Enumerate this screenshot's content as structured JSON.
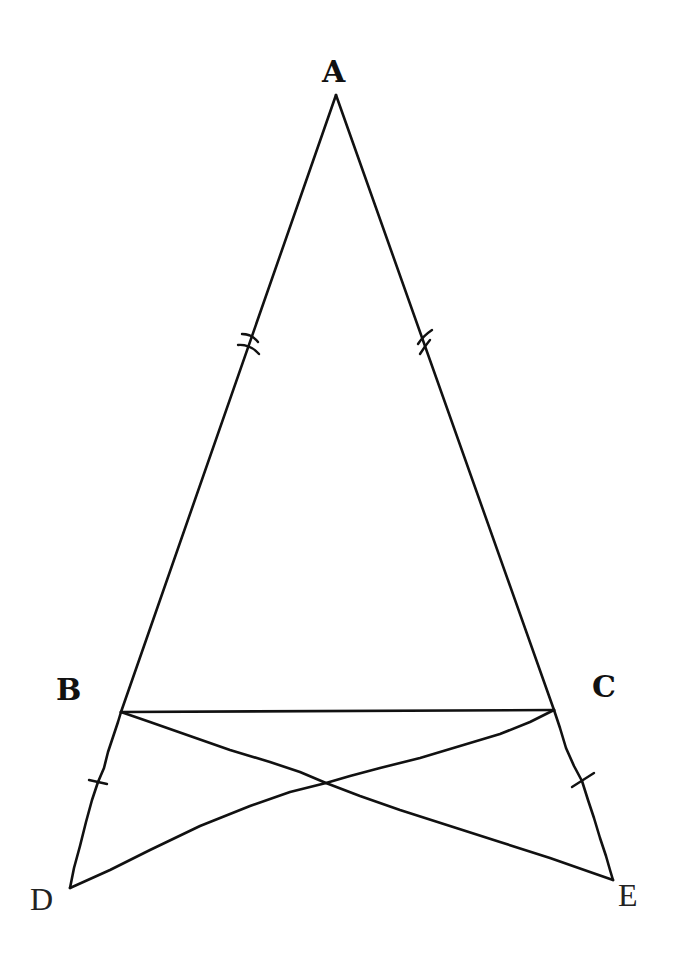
{
  "diagram": {
    "type": "geometry",
    "points": {
      "A": {
        "label": "A",
        "x": 336,
        "y": 95
      },
      "B": {
        "label": "B",
        "x": 121,
        "y": 712
      },
      "C": {
        "label": "C",
        "x": 554,
        "y": 710
      },
      "D": {
        "label": "D",
        "x": 70,
        "y": 888
      },
      "E": {
        "label": "E",
        "x": 613,
        "y": 880
      }
    },
    "segments": [
      {
        "from": "A",
        "to": "B"
      },
      {
        "from": "A",
        "to": "C"
      },
      {
        "from": "B",
        "to": "C"
      },
      {
        "from": "B",
        "to": "D"
      },
      {
        "from": "C",
        "to": "E"
      },
      {
        "from": "B",
        "to": "E"
      },
      {
        "from": "C",
        "to": "D"
      }
    ],
    "equal_marks": [
      {
        "segment": "AB",
        "ticks": 2
      },
      {
        "segment": "AC",
        "ticks": 2
      },
      {
        "segment": "BD",
        "ticks": 1
      },
      {
        "segment": "CE",
        "ticks": 1
      }
    ],
    "labels": {
      "A": "A",
      "B": "B",
      "C": "C",
      "D": "D",
      "E": "E"
    },
    "colors": {
      "stroke": "#111111",
      "background": "#ffffff"
    }
  }
}
